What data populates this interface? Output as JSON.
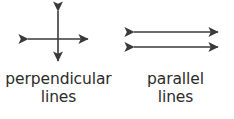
{
  "image": {
    "kind": "geometry-diagram",
    "background_color": "#ffffff",
    "stroke_color": "#3a3a3a",
    "text_color": "#2b2b2b"
  },
  "figures": [
    {
      "id": "perpendicular",
      "icon_name": "perpendicular-lines-icon",
      "description": "two double-headed arrows crossing at right angles",
      "caption_line_1": "perpendicular",
      "caption_line_2": "lines",
      "arrows": [
        {
          "name": "vertical-arrow",
          "orientation": "vertical",
          "double_headed": true
        },
        {
          "name": "horizontal-arrow",
          "orientation": "horizontal",
          "double_headed": true
        }
      ]
    },
    {
      "id": "parallel",
      "icon_name": "parallel-lines-icon",
      "description": "two horizontal double-headed arrows, one above the other",
      "caption_line_1": "parallel",
      "caption_line_2": "lines",
      "arrows": [
        {
          "name": "upper-arrow",
          "orientation": "horizontal",
          "double_headed": true
        },
        {
          "name": "lower-arrow",
          "orientation": "horizontal",
          "double_headed": true
        }
      ]
    }
  ]
}
